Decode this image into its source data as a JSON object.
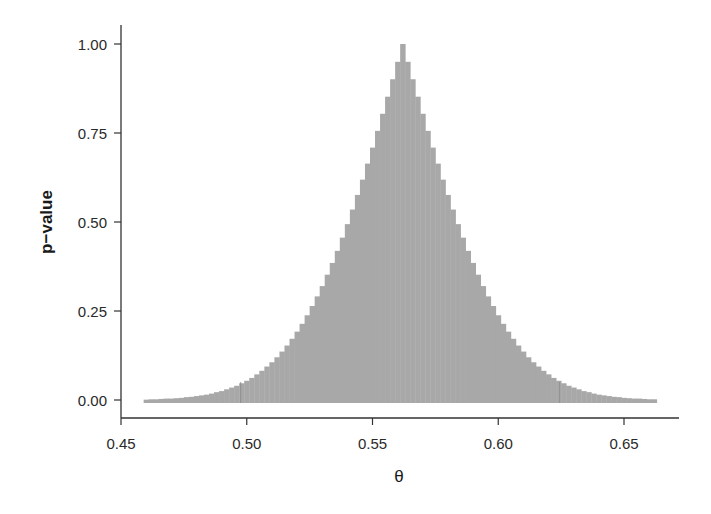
{
  "chart_data": {
    "type": "bar",
    "title": "",
    "xlabel": "θ",
    "ylabel": "p−value",
    "xlim": [
      0.45,
      0.67
    ],
    "ylim": [
      -0.05,
      1.04
    ],
    "grid": false,
    "legend": null,
    "bar_color": "#a8a8a8",
    "ci_marker_color": "#8f8f8f",
    "bin_width": 0.002,
    "peak_theta": 0.562,
    "ci_95": [
      0.4976,
      0.6244
    ],
    "x_ticks": [
      0.45,
      0.5,
      0.55,
      0.6,
      0.65
    ],
    "x_tick_labels": [
      "0.45",
      "0.50",
      "0.55",
      "0.60",
      "0.65"
    ],
    "y_ticks": [
      0.0,
      0.25,
      0.5,
      0.75,
      1.0
    ],
    "y_tick_labels": [
      "0.00",
      "0.25",
      "0.50",
      "0.75",
      "1.00"
    ],
    "x": [
      0.46,
      0.462,
      0.464,
      0.466,
      0.468,
      0.47,
      0.472,
      0.474,
      0.476,
      0.478,
      0.48,
      0.482,
      0.484,
      0.486,
      0.488,
      0.49,
      0.492,
      0.494,
      0.496,
      0.498,
      0.5,
      0.502,
      0.504,
      0.506,
      0.508,
      0.51,
      0.512,
      0.514,
      0.516,
      0.518,
      0.52,
      0.522,
      0.524,
      0.526,
      0.528,
      0.53,
      0.532,
      0.534,
      0.536,
      0.538,
      0.54,
      0.542,
      0.544,
      0.546,
      0.548,
      0.55,
      0.552,
      0.554,
      0.556,
      0.558,
      0.56,
      0.562,
      0.564,
      0.566,
      0.568,
      0.57,
      0.572,
      0.574,
      0.576,
      0.578,
      0.58,
      0.582,
      0.584,
      0.586,
      0.588,
      0.59,
      0.592,
      0.594,
      0.596,
      0.598,
      0.6,
      0.602,
      0.604,
      0.606,
      0.608,
      0.61,
      0.612,
      0.614,
      0.616,
      0.618,
      0.62,
      0.622,
      0.624,
      0.626,
      0.628,
      0.63,
      0.632,
      0.634,
      0.636,
      0.638,
      0.64,
      0.642,
      0.644,
      0.646,
      0.648,
      0.65,
      0.652,
      0.654,
      0.656,
      0.658,
      0.66,
      0.662
    ],
    "values": [
      0.001,
      0.002,
      0.002,
      0.003,
      0.004,
      0.004,
      0.005,
      0.006,
      0.008,
      0.009,
      0.011,
      0.013,
      0.015,
      0.018,
      0.022,
      0.025,
      0.03,
      0.035,
      0.04,
      0.047,
      0.054,
      0.062,
      0.072,
      0.082,
      0.094,
      0.106,
      0.12,
      0.136,
      0.153,
      0.172,
      0.192,
      0.214,
      0.238,
      0.264,
      0.291,
      0.32,
      0.352,
      0.385,
      0.419,
      0.456,
      0.494,
      0.535,
      0.576,
      0.619,
      0.664,
      0.709,
      0.756,
      0.804,
      0.852,
      0.901,
      0.95,
      1.0,
      0.95,
      0.901,
      0.852,
      0.804,
      0.756,
      0.709,
      0.664,
      0.619,
      0.576,
      0.535,
      0.494,
      0.456,
      0.419,
      0.385,
      0.352,
      0.32,
      0.291,
      0.264,
      0.238,
      0.214,
      0.192,
      0.172,
      0.153,
      0.136,
      0.12,
      0.106,
      0.094,
      0.082,
      0.072,
      0.062,
      0.054,
      0.047,
      0.04,
      0.035,
      0.03,
      0.025,
      0.022,
      0.018,
      0.015,
      0.013,
      0.011,
      0.009,
      0.008,
      0.006,
      0.005,
      0.004,
      0.004,
      0.003,
      0.002,
      0.002
    ]
  }
}
